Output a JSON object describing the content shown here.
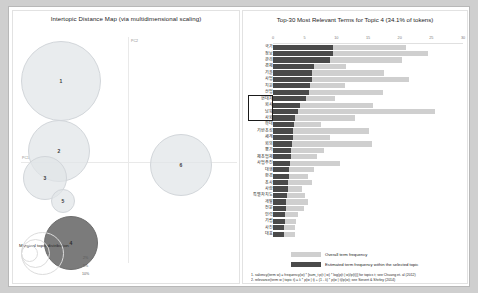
{
  "left_panel": {
    "title": "Intertopic Distance Map (via multidimensional scaling)",
    "axis_labels": {
      "x": "PC1",
      "y": "PC2"
    },
    "marginal_legend": {
      "label": "Marginal topic distribution",
      "ticks": [
        "2%",
        "5%",
        "10%"
      ]
    },
    "topics": [
      {
        "id": "1",
        "label": "1",
        "x": 48,
        "y": 70,
        "r": 40,
        "selected": false
      },
      {
        "id": "2",
        "label": "2",
        "x": 46,
        "y": 140,
        "r": 31,
        "selected": false
      },
      {
        "id": "3",
        "label": "3",
        "x": 32,
        "y": 167,
        "r": 22,
        "selected": false
      },
      {
        "id": "5",
        "label": "5",
        "x": 50,
        "y": 190,
        "r": 12,
        "selected": false
      },
      {
        "id": "6",
        "label": "6",
        "x": 168,
        "y": 154,
        "r": 31,
        "selected": false
      },
      {
        "id": "4",
        "label": "4",
        "x": 58,
        "y": 232,
        "r": 27,
        "selected": true
      }
    ]
  },
  "right_panel": {
    "title": "Top-30 Most Relevant Terms for Topic 4 (34.1% of tokens)",
    "legend": {
      "overall": "Overall term frequency",
      "within": "Estimated term frequency within the selected topic"
    },
    "notes": [
      "1. saliency(term w) = frequency(w) * [sum_t p(t | w) * log(p(t | w)/p(t))] for topics t; see Chuang et. al (2012)",
      "2. relevance(term w | topic t) = λ * p(w | t) + (1 - λ) * p(w | t)/p(w); see Sievert & Shirley (2014)"
    ]
  },
  "chart_data": {
    "type": "bar",
    "title": "Top-30 Most Relevant Terms for Topic 4 (34.1% of tokens)",
    "xlabel": "",
    "ylabel": "",
    "xlim": [
      0,
      30
    ],
    "xticks": [
      0,
      5,
      10,
      15,
      20,
      25,
      30
    ],
    "grid": false,
    "legend_position": "bottom-left",
    "orientation": "horizontal",
    "categories": [
      "국가",
      "정보",
      "관리",
      "경제",
      "기술",
      "사업",
      "지원",
      "산업",
      "현대차",
      "회사",
      "남북",
      "사회",
      "확대",
      "기반조성",
      "세계",
      "회의",
      "평가",
      "제조업체",
      "사업추진",
      "대행",
      "환경",
      "조사",
      "사람",
      "특별자치도",
      "개발",
      "전문",
      "인력",
      "기립",
      "사진",
      "대표"
    ],
    "series": [
      {
        "name": "Overall term frequency",
        "values": [
          21.0,
          24.5,
          20.3,
          11.6,
          17.6,
          21.4,
          11.4,
          17.4,
          9.8,
          15.8,
          25.5,
          13.0,
          7.6,
          15.2,
          9.0,
          15.6,
          8.0,
          7.0,
          10.5,
          6.4,
          5.6,
          6.2,
          4.6,
          5.0,
          5.6,
          4.9,
          4.0,
          3.6,
          3.5,
          3.4
        ]
      },
      {
        "name": "Estimated term frequency within the selected topic",
        "values": [
          9.5,
          9.4,
          9.0,
          6.5,
          6.2,
          6.1,
          5.9,
          5.7,
          5.2,
          4.3,
          3.9,
          3.4,
          3.3,
          3.2,
          3.1,
          3.0,
          2.9,
          2.8,
          2.7,
          2.6,
          2.5,
          2.4,
          2.3,
          2.2,
          2.1,
          2.0,
          1.9,
          1.85,
          1.8,
          1.75
        ]
      }
    ],
    "highlighted_terms": [
      "현대차",
      "회사",
      "남북",
      "사회"
    ]
  }
}
